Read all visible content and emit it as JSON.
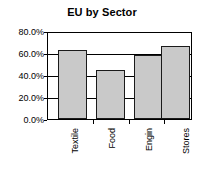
{
  "chart_data": {
    "type": "bar",
    "title": "EU by Sector",
    "xlabel": "",
    "ylabel": "",
    "categories": [
      "Textile",
      "Food",
      "Engin",
      "Stores"
    ],
    "values": [
      0.64,
      0.46,
      0.6,
      0.68
    ],
    "value_labels": [
      "64.0%",
      "46.0%",
      "60.0%",
      "68.0%"
    ],
    "ylim": [
      0,
      0.8
    ],
    "ytick_values": [
      0.8,
      0.6,
      0.4,
      0.2,
      0
    ],
    "ytick_labels": [
      "80.0%",
      "60.0%",
      "40.0%",
      "20.0%",
      "0.0%"
    ],
    "grid": true,
    "legend": false,
    "legend_position": "none",
    "series_color": "#c9c9c9",
    "border_color": "#1a1a1a",
    "axis_color": "#000000"
  }
}
